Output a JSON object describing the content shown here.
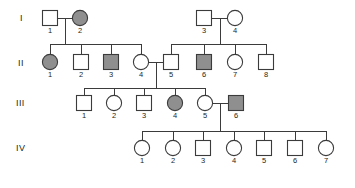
{
  "figure": {
    "type": "pedigree-chart",
    "title": "",
    "background_color": "#ffffff",
    "line_color": "#3b3b3b",
    "affected_fill": "#8f8f8f",
    "unaffected_fill": "#ffffff",
    "legend": {
      "square_meaning": "male",
      "circle_meaning": "female",
      "shaded_meaning": "affected"
    }
  },
  "generations": [
    {
      "label": "I",
      "label_x": 20,
      "label_y": 21
    },
    {
      "label": "II",
      "label_x": 18,
      "label_y": 66
    },
    {
      "label": "III",
      "label_x": 16,
      "label_y": 106
    },
    {
      "label": "IV",
      "label_x": 16,
      "label_y": 151
    }
  ],
  "individuals": [
    {
      "id": "I-1",
      "generation": "I",
      "number": "1",
      "shape": "square",
      "affected": false,
      "cx": 50,
      "cy": 18
    },
    {
      "id": "I-2",
      "generation": "I",
      "number": "2",
      "shape": "circle",
      "affected": true,
      "cx": 80,
      "cy": 18
    },
    {
      "id": "I-3",
      "generation": "I",
      "number": "3",
      "shape": "square",
      "affected": false,
      "cx": 204,
      "cy": 18
    },
    {
      "id": "I-4",
      "generation": "I",
      "number": "4",
      "shape": "circle",
      "affected": false,
      "cx": 235,
      "cy": 18
    },
    {
      "id": "II-1",
      "generation": "II",
      "number": "1",
      "shape": "circle",
      "affected": true,
      "cx": 50,
      "cy": 62
    },
    {
      "id": "II-2",
      "generation": "II",
      "number": "2",
      "shape": "square",
      "affected": false,
      "cx": 81,
      "cy": 62
    },
    {
      "id": "II-3",
      "generation": "II",
      "number": "3",
      "shape": "square",
      "affected": true,
      "cx": 111,
      "cy": 62
    },
    {
      "id": "II-4",
      "generation": "II",
      "number": "4",
      "shape": "circle",
      "affected": false,
      "cx": 141,
      "cy": 62
    },
    {
      "id": "II-5",
      "generation": "II",
      "number": "5",
      "shape": "square",
      "affected": false,
      "cx": 171,
      "cy": 62
    },
    {
      "id": "II-6",
      "generation": "II",
      "number": "6",
      "shape": "square",
      "affected": true,
      "cx": 204,
      "cy": 62
    },
    {
      "id": "II-7",
      "generation": "II",
      "number": "7",
      "shape": "circle",
      "affected": false,
      "cx": 235,
      "cy": 62
    },
    {
      "id": "II-8",
      "generation": "II",
      "number": "8",
      "shape": "square",
      "affected": false,
      "cx": 266,
      "cy": 62
    },
    {
      "id": "III-1",
      "generation": "III",
      "number": "1",
      "shape": "square",
      "affected": false,
      "cx": 84,
      "cy": 103
    },
    {
      "id": "III-2",
      "generation": "III",
      "number": "2",
      "shape": "circle",
      "affected": false,
      "cx": 114,
      "cy": 103
    },
    {
      "id": "III-3",
      "generation": "III",
      "number": "3",
      "shape": "square",
      "affected": false,
      "cx": 144,
      "cy": 103
    },
    {
      "id": "III-4",
      "generation": "III",
      "number": "4",
      "shape": "circle",
      "affected": true,
      "cx": 175,
      "cy": 103
    },
    {
      "id": "III-5",
      "generation": "III",
      "number": "5",
      "shape": "circle",
      "affected": false,
      "cx": 205,
      "cy": 103
    },
    {
      "id": "III-6",
      "generation": "III",
      "number": "6",
      "shape": "square",
      "affected": true,
      "cx": 236,
      "cy": 103
    },
    {
      "id": "IV-1",
      "generation": "IV",
      "number": "1",
      "shape": "circle",
      "affected": false,
      "cx": 142,
      "cy": 148
    },
    {
      "id": "IV-2",
      "generation": "IV",
      "number": "2",
      "shape": "circle",
      "affected": false,
      "cx": 173,
      "cy": 148
    },
    {
      "id": "IV-3",
      "generation": "IV",
      "number": "3",
      "shape": "square",
      "affected": false,
      "cx": 203,
      "cy": 148
    },
    {
      "id": "IV-4",
      "generation": "IV",
      "number": "4",
      "shape": "circle",
      "affected": false,
      "cx": 234,
      "cy": 148
    },
    {
      "id": "IV-5",
      "generation": "IV",
      "number": "5",
      "shape": "square",
      "affected": false,
      "cx": 264,
      "cy": 148
    },
    {
      "id": "IV-6",
      "generation": "IV",
      "number": "6",
      "shape": "square",
      "affected": false,
      "cx": 295,
      "cy": 148
    },
    {
      "id": "IV-7",
      "generation": "IV",
      "number": "7",
      "shape": "circle",
      "affected": false,
      "cx": 326,
      "cy": 148
    }
  ],
  "matings": [
    {
      "id": "mating-I1-I2",
      "partners": [
        "I-1",
        "I-2"
      ],
      "y": 18,
      "x1": 58,
      "x2": 72
    },
    {
      "id": "mating-I3-I4",
      "partners": [
        "I-3",
        "I-4"
      ],
      "y": 18,
      "x1": 212,
      "x2": 228
    },
    {
      "id": "mating-II4-II5",
      "partners": [
        "II-4",
        "II-5"
      ],
      "y": 62,
      "x1": 149,
      "x2": 163
    },
    {
      "id": "mating-III5-III6",
      "partners": [
        "III-5",
        "III-6"
      ],
      "y": 103,
      "x1": 213,
      "x2": 228
    }
  ],
  "sibships": [
    {
      "id": "sibship-gen-II-left",
      "parents": "mating-I1-I2",
      "drop_x": 65,
      "line_y": 44,
      "x1": 50,
      "x2": 141,
      "children": [
        "II-1",
        "II-2",
        "II-3",
        "II-4"
      ]
    },
    {
      "id": "sibship-gen-II-right",
      "parents": "mating-I3-I4",
      "drop_x": 220,
      "line_y": 44,
      "x1": 171,
      "x2": 266,
      "children": [
        "II-5",
        "II-6",
        "II-7",
        "II-8"
      ]
    },
    {
      "id": "sibship-gen-III",
      "parents": "mating-II4-II5",
      "drop_x": 156,
      "line_y": 88,
      "x1": 84,
      "x2": 205,
      "children": [
        "III-1",
        "III-2",
        "III-3",
        "III-4",
        "III-5"
      ]
    },
    {
      "id": "sibship-gen-IV",
      "parents": "mating-III5-III6",
      "drop_x": 220,
      "line_y": 131,
      "x1": 142,
      "x2": 326,
      "children": [
        "IV-1",
        "IV-2",
        "IV-3",
        "IV-4",
        "IV-5",
        "IV-6",
        "IV-7"
      ]
    }
  ]
}
